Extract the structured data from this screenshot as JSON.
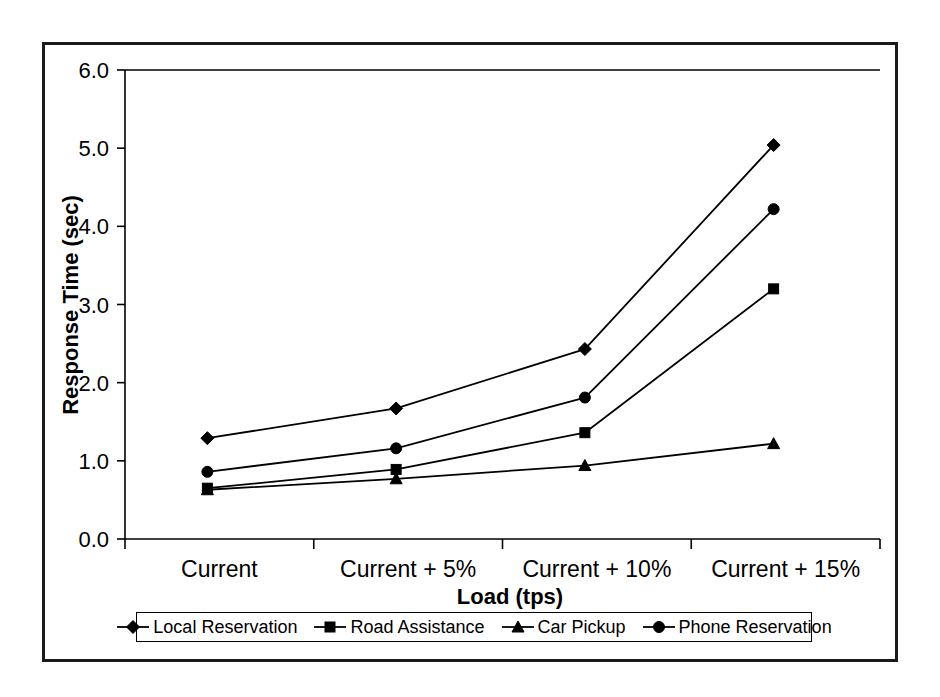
{
  "chart_data": {
    "type": "line",
    "title": "",
    "subtitle": "",
    "xlabel": "Load (tps)",
    "ylabel": "Response Time (sec)",
    "categories": [
      "Current",
      "Current + 5%",
      "Current + 10%",
      "Current + 15%"
    ],
    "ylim": [
      0.0,
      6.0
    ],
    "yticks": [
      "0.0",
      "1.0",
      "2.0",
      "3.0",
      "4.0",
      "5.0",
      "6.0"
    ],
    "ytick_values": [
      0.0,
      1.0,
      2.0,
      3.0,
      4.0,
      5.0,
      6.0
    ],
    "grid": false,
    "legend_position": "bottom",
    "series": [
      {
        "name": "Local Reservation",
        "marker": "diamond",
        "color": "#000000",
        "values": [
          1.29,
          1.67,
          2.43,
          5.04
        ]
      },
      {
        "name": "Road Assistance",
        "marker": "square",
        "color": "#000000",
        "values": [
          0.65,
          0.89,
          1.36,
          3.2
        ]
      },
      {
        "name": "Car Pickup",
        "marker": "triangle",
        "color": "#000000",
        "values": [
          0.63,
          0.77,
          0.94,
          1.22
        ]
      },
      {
        "name": "Phone Reservation",
        "marker": "circle",
        "color": "#000000",
        "values": [
          0.86,
          1.16,
          1.81,
          4.22
        ]
      }
    ]
  },
  "legend": {
    "items": [
      {
        "label": "Local Reservation",
        "marker": "diamond"
      },
      {
        "label": "Road Assistance",
        "marker": "square"
      },
      {
        "label": "Car Pickup",
        "marker": "triangle"
      },
      {
        "label": "Phone Reservation",
        "marker": "circle"
      }
    ]
  },
  "colors": {
    "ink": "#000000",
    "frame": "#1a1a1a",
    "background": "#ffffff"
  }
}
